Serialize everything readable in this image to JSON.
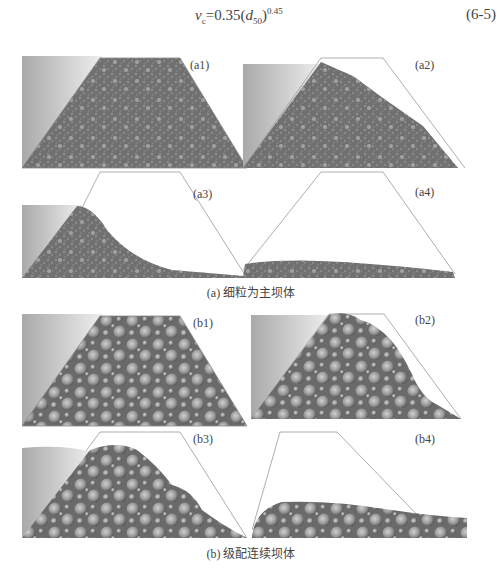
{
  "equation": {
    "lhs": "v",
    "lhs_sub": "c",
    "rhs_coef": "=0.35(",
    "rhs_var": "d",
    "rhs_var_sub": "50",
    "rhs_close": ")",
    "rhs_exp": "0.45",
    "number": "(6-5)"
  },
  "figure": {
    "group_a": {
      "caption": "(a) 细粒为主坝体",
      "panels": [
        {
          "label": "(a1)"
        },
        {
          "label": "(a2)"
        },
        {
          "label": "(a3)"
        },
        {
          "label": "(a4)"
        }
      ]
    },
    "group_b": {
      "caption": "(b) 级配连续坝体",
      "panels": [
        {
          "label": "(b1)"
        },
        {
          "label": "(b2)"
        },
        {
          "label": "(b3)"
        },
        {
          "label": "(b4)"
        }
      ]
    }
  },
  "colors": {
    "water_dark": "#a8a8a8",
    "water_light": "#f2f2f2",
    "dam_fill": "#6e6e6e",
    "particle": "#9a9a9a",
    "outline": "#888888"
  }
}
